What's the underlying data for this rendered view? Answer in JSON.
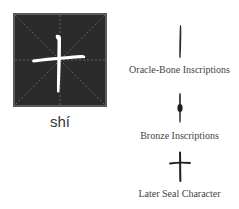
{
  "character": {
    "glyph": "十",
    "pinyin": "shí",
    "box_background": "#2b2b2b",
    "box_border": "#5a5a5a",
    "glyph_color": "#ffffff",
    "guide_line_color": "#6e6e6e"
  },
  "scripts": [
    {
      "label": "Oracle-Bone Inscriptions",
      "icon": "oracle-bone-glyph"
    },
    {
      "label": "Bronze Inscriptions",
      "icon": "bronze-glyph"
    },
    {
      "label": "Later Seal Character",
      "icon": "seal-glyph"
    }
  ]
}
